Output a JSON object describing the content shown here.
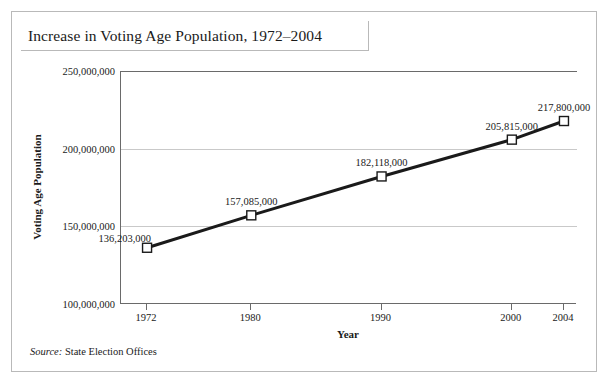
{
  "figure": {
    "title": "Increase in Voting Age Population, 1972–2004",
    "source_label": "Source:",
    "source_text": " State Election Offices"
  },
  "chart_data": {
    "type": "line",
    "title": "Increase in Voting Age Population, 1972–2004",
    "xlabel": "Year",
    "ylabel": "Voting Age Population",
    "x": [
      1972,
      1980,
      1990,
      2000,
      2004
    ],
    "categories": [
      "1972",
      "1980",
      "1990",
      "2000",
      "2004"
    ],
    "values": [
      136203000,
      157085000,
      182118000,
      205815000,
      217800000
    ],
    "point_labels": [
      "136,203,000",
      "157,085,000",
      "182,118,000",
      "205,815,000",
      "217,800,000"
    ],
    "xlim": [
      1970,
      2005
    ],
    "ylim": [
      100000000,
      250000000
    ],
    "ytick_values": [
      100000000,
      150000000,
      200000000,
      250000000
    ],
    "ytick_labels": [
      "100,000,000",
      "150,000,000",
      "200,000,000",
      "250,000,000"
    ],
    "xtick_labels": [
      "1972",
      "1980",
      "1990",
      "2000",
      "2004"
    ],
    "grid": true,
    "grid_axis": "y",
    "legend": false,
    "marker": "square-open",
    "line_color": "#1a1a1a",
    "marker_face_color": "#ffffff",
    "grid_color": "#c9c9c9",
    "axis_color": "#6a6a6a",
    "frame_color": "#b9b9b9"
  }
}
